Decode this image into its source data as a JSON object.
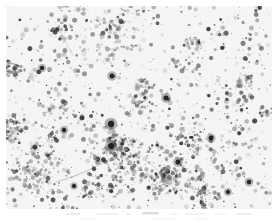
{
  "figure": {
    "kind": "micrograph",
    "modality": "brightfield-light-microscopy",
    "staining_appearance": "dark punctate chromogenic deposits on pale background",
    "caption": "",
    "scale_bar_label": "",
    "width_px": 277,
    "height_px": 223
  },
  "page": {
    "background_color": "#ffffff",
    "margin_left_px": 6,
    "margin_top_px": 6,
    "margin_right_px": 5,
    "margin_bottom_px": 14
  },
  "field": {
    "x_px": 6,
    "y_px": 6,
    "width_px": 266,
    "height_px": 203,
    "background_color": "#f5f5f3",
    "background_noise_amplitude": 6,
    "vignette": true
  },
  "particles": {
    "random_seed": 20240517,
    "total_count": 2600,
    "size_min_px": 0.45,
    "size_max_px": 2.6,
    "color_dark": "#2b2b2b",
    "color_mid": "#6e6e70",
    "color_light": "#a8a8aa",
    "opacity_min": 0.18,
    "opacity_max": 0.92,
    "clustering": {
      "cluster_count": 46,
      "cluster_radius_min_px": 9,
      "cluster_radius_max_px": 34,
      "fraction_in_clusters": 0.62
    }
  },
  "focal_spots": {
    "description": "a few conspicuously large, very dark deposits",
    "color": "#1d1d1d",
    "items": [
      {
        "x": 105,
        "y": 118,
        "r": 3.3
      },
      {
        "x": 105,
        "y": 140,
        "r": 3.1
      },
      {
        "x": 160,
        "y": 92,
        "r": 2.6
      },
      {
        "x": 106,
        "y": 70,
        "r": 2.5
      },
      {
        "x": 205,
        "y": 132,
        "r": 2.4
      },
      {
        "x": 172,
        "y": 156,
        "r": 2.6
      },
      {
        "x": 243,
        "y": 176,
        "r": 2.3
      },
      {
        "x": 149,
        "y": 208,
        "r": 2.5
      },
      {
        "x": 36,
        "y": 62,
        "r": 2.2
      },
      {
        "x": 58,
        "y": 124,
        "r": 2.2
      },
      {
        "x": 222,
        "y": 186,
        "r": 2.1
      },
      {
        "x": 68,
        "y": 180,
        "r": 2.0
      }
    ]
  },
  "density_map": {
    "description": "relative particle density across a 4x3 grid of the field, 0..1",
    "cols": 4,
    "rows": 3,
    "values": [
      [
        0.52,
        0.62,
        0.58,
        0.7
      ],
      [
        0.68,
        0.8,
        0.86,
        0.95
      ],
      [
        0.74,
        0.78,
        0.82,
        0.88
      ]
    ]
  },
  "filaments": {
    "description": "faint stringy chains linking neighbouring clusters",
    "count": 30,
    "color": "#8d8d90",
    "opacity": 0.3,
    "width_px": 0.8
  },
  "bottom_smudges": {
    "description": "faint degraded gray marks along the lower page margin",
    "color": "#cfcfcf",
    "items": [
      {
        "x": 66,
        "y": 3,
        "w": 14,
        "h": 2.0,
        "o": 0.4
      },
      {
        "x": 96,
        "y": 3,
        "w": 22,
        "h": 1.8,
        "o": 0.32
      },
      {
        "x": 126,
        "y": 3,
        "w": 6,
        "h": 1.6,
        "o": 0.3
      },
      {
        "x": 142,
        "y": 2,
        "w": 17,
        "h": 2.4,
        "o": 0.7
      },
      {
        "x": 170,
        "y": 3,
        "w": 9,
        "h": 1.6,
        "o": 0.28
      },
      {
        "x": 186,
        "y": 3,
        "w": 20,
        "h": 1.8,
        "o": 0.3
      },
      {
        "x": 214,
        "y": 3,
        "w": 12,
        "h": 1.6,
        "o": 0.26
      },
      {
        "x": 236,
        "y": 3,
        "w": 16,
        "h": 1.8,
        "o": 0.34
      },
      {
        "x": 80,
        "y": 8,
        "w": 18,
        "h": 1.4,
        "o": 0.18
      },
      {
        "x": 150,
        "y": 8,
        "w": 26,
        "h": 1.4,
        "o": 0.2
      },
      {
        "x": 196,
        "y": 8,
        "w": 14,
        "h": 1.4,
        "o": 0.18
      }
    ]
  }
}
